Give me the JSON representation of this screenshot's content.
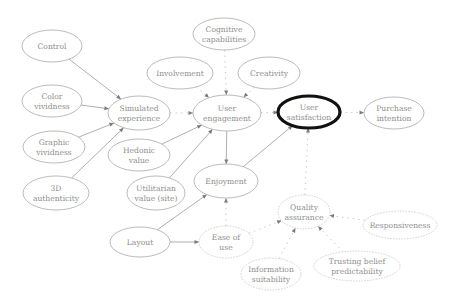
{
  "diagram": {
    "title": "",
    "colors": {
      "node_stroke": "#a9a9a9",
      "focus_stroke": "#111111",
      "edge": "#9a9a9a",
      "text": "#8e8e8e",
      "background": "#ffffff"
    },
    "nodes": [
      {
        "id": "control",
        "lines": [
          "Control"
        ],
        "cx": 52,
        "cy": 46,
        "rx": 30,
        "ry": 16,
        "style": "normal"
      },
      {
        "id": "color_vividness",
        "lines": [
          "Color",
          "vividness"
        ],
        "cx": 52,
        "cy": 101,
        "rx": 30,
        "ry": 16,
        "style": "normal"
      },
      {
        "id": "graphic_vividness",
        "lines": [
          "Graphic",
          "vividness"
        ],
        "cx": 54,
        "cy": 147,
        "rx": 31,
        "ry": 16,
        "style": "normal"
      },
      {
        "id": "authenticity_3d",
        "lines": [
          "3D",
          "authenticity"
        ],
        "cx": 56,
        "cy": 193,
        "rx": 33,
        "ry": 17,
        "style": "normal"
      },
      {
        "id": "simulated_experience",
        "lines": [
          "Simulated",
          "experience"
        ],
        "cx": 139,
        "cy": 113,
        "rx": 31,
        "ry": 17,
        "style": "normal"
      },
      {
        "id": "hedonic_value",
        "lines": [
          "Hedonic",
          "value"
        ],
        "cx": 139,
        "cy": 155,
        "rx": 31,
        "ry": 16,
        "style": "normal"
      },
      {
        "id": "utilitarian_value",
        "lines": [
          "Utilitarian",
          "value (site)"
        ],
        "cx": 156,
        "cy": 193,
        "rx": 29,
        "ry": 17,
        "style": "normal"
      },
      {
        "id": "layout",
        "lines": [
          "Layout"
        ],
        "cx": 140,
        "cy": 242,
        "rx": 30,
        "ry": 15,
        "style": "normal"
      },
      {
        "id": "cognitive_capabilities",
        "lines": [
          "Cognitive",
          "capabilities"
        ],
        "cx": 224,
        "cy": 34,
        "rx": 31,
        "ry": 16,
        "style": "normal"
      },
      {
        "id": "involvement",
        "lines": [
          "Involvement"
        ],
        "cx": 180,
        "cy": 73,
        "rx": 33,
        "ry": 16,
        "style": "normal"
      },
      {
        "id": "creativity",
        "lines": [
          "Creativity"
        ],
        "cx": 269,
        "cy": 73,
        "rx": 31,
        "ry": 16,
        "style": "normal"
      },
      {
        "id": "user_engagement",
        "lines": [
          "User",
          "engagement"
        ],
        "cx": 227,
        "cy": 113,
        "rx": 34,
        "ry": 18,
        "style": "normal"
      },
      {
        "id": "enjoyment",
        "lines": [
          "Enjoyment"
        ],
        "cx": 226,
        "cy": 181,
        "rx": 32,
        "ry": 17,
        "style": "normal"
      },
      {
        "id": "user_satisfaction",
        "lines": [
          "User",
          "satisfaction"
        ],
        "cx": 309,
        "cy": 112,
        "rx": 31,
        "ry": 16,
        "style": "focus"
      },
      {
        "id": "purchase_intention",
        "lines": [
          "Purchase",
          "intention"
        ],
        "cx": 394,
        "cy": 113,
        "rx": 30,
        "ry": 16,
        "style": "normal"
      },
      {
        "id": "ease_of_use",
        "lines": [
          "Ease of",
          "use"
        ],
        "cx": 226,
        "cy": 242,
        "rx": 27,
        "ry": 16,
        "style": "faint"
      },
      {
        "id": "quality_assurance",
        "lines": [
          "Quality",
          "assurance"
        ],
        "cx": 304,
        "cy": 212,
        "rx": 26,
        "ry": 17,
        "style": "faint"
      },
      {
        "id": "responsiveness",
        "lines": [
          "Responsiveness"
        ],
        "cx": 400,
        "cy": 225,
        "rx": 37,
        "ry": 14,
        "style": "faint"
      },
      {
        "id": "information_suitability",
        "lines": [
          "Information",
          "suitability"
        ],
        "cx": 271,
        "cy": 274,
        "rx": 30,
        "ry": 16,
        "style": "faint"
      },
      {
        "id": "trusting_belief_predictability",
        "lines": [
          "Trusting belief",
          "predictability"
        ],
        "cx": 357,
        "cy": 266,
        "rx": 43,
        "ry": 15,
        "style": "faint"
      }
    ],
    "edges": [
      {
        "from": "control",
        "to": "simulated_experience",
        "style": "solid"
      },
      {
        "from": "color_vividness",
        "to": "simulated_experience",
        "style": "solid"
      },
      {
        "from": "graphic_vividness",
        "to": "simulated_experience",
        "style": "solid"
      },
      {
        "from": "authenticity_3d",
        "to": "simulated_experience",
        "style": "solid"
      },
      {
        "from": "simulated_experience",
        "to": "user_engagement",
        "style": "dotted"
      },
      {
        "from": "hedonic_value",
        "to": "user_engagement",
        "style": "solid"
      },
      {
        "from": "utilitarian_value",
        "to": "user_engagement",
        "style": "solid"
      },
      {
        "from": "involvement",
        "to": "user_engagement",
        "style": "dotted"
      },
      {
        "from": "cognitive_capabilities",
        "to": "user_engagement",
        "style": "dotted"
      },
      {
        "from": "creativity",
        "to": "user_engagement",
        "style": "dotted"
      },
      {
        "from": "user_engagement",
        "to": "user_satisfaction",
        "style": "dotted"
      },
      {
        "from": "user_engagement",
        "to": "enjoyment",
        "style": "solid"
      },
      {
        "from": "enjoyment",
        "to": "user_satisfaction",
        "style": "solid"
      },
      {
        "from": "user_satisfaction",
        "to": "purchase_intention",
        "style": "dotted"
      },
      {
        "from": "layout",
        "to": "enjoyment",
        "style": "solid"
      },
      {
        "from": "layout",
        "to": "ease_of_use",
        "style": "solid"
      },
      {
        "from": "ease_of_use",
        "to": "enjoyment",
        "style": "dotted"
      },
      {
        "from": "quality_assurance",
        "to": "user_satisfaction",
        "style": "dotted"
      },
      {
        "from": "ease_of_use",
        "to": "quality_assurance",
        "style": "dotted"
      },
      {
        "from": "information_suitability",
        "to": "quality_assurance",
        "style": "dotted"
      },
      {
        "from": "trusting_belief_predictability",
        "to": "quality_assurance",
        "style": "dotted"
      },
      {
        "from": "responsiveness",
        "to": "quality_assurance",
        "style": "dotted"
      }
    ]
  }
}
